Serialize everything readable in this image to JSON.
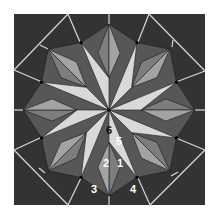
{
  "diagram": {
    "type": "quilt-block-pattern",
    "geometry": {
      "square": {
        "x": 14,
        "y": 14,
        "size": 191
      },
      "center": [
        109,
        110
      ],
      "diamond_tip_radius": 86,
      "valley_dot_radius": 73,
      "blade_inner_radius": 32,
      "points": 8
    },
    "colors": {
      "background": "#333333",
      "page": "#ffffff",
      "light_blade": "#d9d9d9",
      "diamond_light": "#a3a3a3",
      "diamond_dark": "#7d7d7d",
      "dark_triangle": "#575757",
      "seam_line": "#1a1a1a",
      "guide_line": "#d8d8d8",
      "dot": "#000000"
    },
    "labels": [
      {
        "text": "6",
        "x": 106,
        "y": 134,
        "color": "#111111"
      },
      {
        "text": "5",
        "x": 116,
        "y": 145,
        "color": "#ffffff"
      },
      {
        "text": "2",
        "x": 103,
        "y": 167,
        "color": "#ffffff"
      },
      {
        "text": "1",
        "x": 117,
        "y": 167,
        "color": "#ffffff"
      },
      {
        "text": "3",
        "x": 91,
        "y": 193,
        "color": "#ffffff"
      },
      {
        "text": "4",
        "x": 130,
        "y": 193,
        "color": "#ffffff"
      }
    ],
    "guide_lines": [
      [
        [
          68,
          14
        ],
        [
          14,
          70
        ]
      ],
      [
        [
          149,
          14
        ],
        [
          205,
          71
        ]
      ],
      [
        [
          205,
          150
        ],
        [
          150,
          205
        ]
      ],
      [
        [
          68,
          205
        ],
        [
          14,
          150
        ]
      ],
      [
        [
          68,
          14
        ],
        [
          80,
          42
        ]
      ],
      [
        [
          149,
          14
        ],
        [
          138,
          42
        ]
      ],
      [
        [
          205,
          71
        ],
        [
          176,
          82
        ]
      ],
      [
        [
          205,
          150
        ],
        [
          176,
          138
        ]
      ],
      [
        [
          150,
          205
        ],
        [
          138,
          178
        ]
      ],
      [
        [
          68,
          205
        ],
        [
          81,
          178
        ]
      ],
      [
        [
          14,
          150
        ],
        [
          42,
          137
        ]
      ],
      [
        [
          14,
          70
        ],
        [
          42,
          82
        ]
      ],
      [
        [
          109,
          14
        ],
        [
          109,
          24
        ]
      ],
      [
        [
          205,
          110
        ],
        [
          195,
          110
        ]
      ],
      [
        [
          109,
          205
        ],
        [
          109,
          196
        ]
      ],
      [
        [
          14,
          110
        ],
        [
          23,
          110
        ]
      ],
      [
        [
          40,
          45
        ],
        [
          48,
          49
        ]
      ],
      [
        [
          173,
          40
        ],
        [
          172,
          47
        ]
      ],
      [
        [
          171,
          176
        ],
        [
          178,
          172
        ]
      ],
      [
        [
          45,
          173
        ],
        [
          39,
          168
        ]
      ]
    ]
  }
}
